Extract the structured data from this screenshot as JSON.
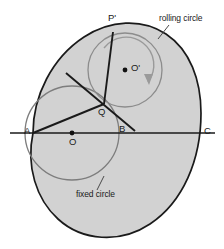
{
  "figure": {
    "colors": {
      "fill": "#d2d2d2",
      "outline": "#1a1a1a",
      "rolling_stroke": "#8c8c8c",
      "fixed_stroke": "#7d7d7d",
      "label": "#1a1a1a",
      "background": "#ffffff",
      "arrow": "#9a9a9a"
    },
    "labels": {
      "rolling_circle": "rolling circle",
      "fixed_circle": "fixed circle",
      "point_p_prime": "P'",
      "point_o_prime": "O'",
      "point_q": "Q",
      "point_a": "A",
      "point_o": "O",
      "point_b": "B",
      "point_c": "C",
      "dash_left": "–",
      "dash_right": "–"
    },
    "geometry": {
      "fixed_circle": {
        "cx": 72,
        "cy": 133,
        "r": 47
      },
      "rolling_circle": {
        "cx": 125,
        "cy": 70,
        "r": 37
      },
      "axis": {
        "x1": 10,
        "y1": 133,
        "x2": 213,
        "y2": 133
      },
      "points": {
        "A": {
          "x": 33,
          "y": 133
        },
        "O": {
          "x": 72,
          "y": 133
        },
        "B": {
          "x": 127,
          "y": 133
        },
        "C": {
          "x": 200,
          "y": 133
        },
        "Q": {
          "x": 104,
          "y": 104
        },
        "P_prime": {
          "x": 113,
          "y": 32
        },
        "O_prime": {
          "x": 125,
          "y": 70
        }
      },
      "cusp": {
        "x": 33,
        "y": 133
      },
      "cardioid_extent_right": 200
    }
  }
}
